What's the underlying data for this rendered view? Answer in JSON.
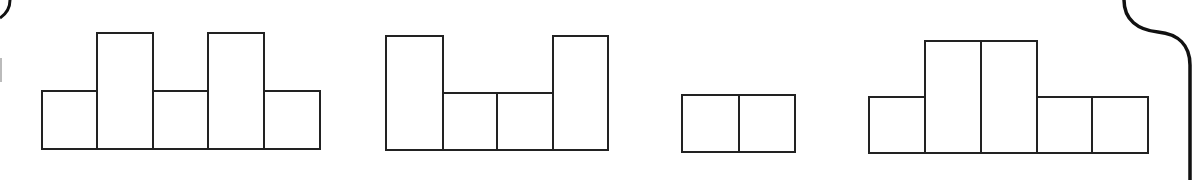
{
  "diagram": {
    "stroke_color": "#222222",
    "background": "#ffffff",
    "figures": [
      {
        "name": "figure-1",
        "columns": [
          {
            "x": 42,
            "width": 55,
            "height_units": 1
          },
          {
            "x": 97,
            "width": 56,
            "height_units": 2
          },
          {
            "x": 153,
            "width": 55,
            "height_units": 1
          },
          {
            "x": 208,
            "width": 56,
            "height_units": 2
          },
          {
            "x": 264,
            "width": 56,
            "height_units": 1
          }
        ]
      },
      {
        "name": "figure-2",
        "columns": [
          {
            "x": 386,
            "width": 57,
            "height_units": 2
          },
          {
            "x": 443,
            "width": 54,
            "height_units": 1
          },
          {
            "x": 497,
            "width": 56,
            "height_units": 1
          },
          {
            "x": 553,
            "width": 55,
            "height_units": 2
          }
        ]
      },
      {
        "name": "figure-3",
        "columns": [
          {
            "x": 682,
            "width": 57,
            "height_units": 1
          },
          {
            "x": 739,
            "width": 56,
            "height_units": 1
          }
        ]
      },
      {
        "name": "figure-4",
        "columns": [
          {
            "x": 869,
            "width": 56,
            "height_units": 1
          },
          {
            "x": 925,
            "width": 56,
            "height_units": 2
          },
          {
            "x": 981,
            "width": 56,
            "height_units": 2
          },
          {
            "x": 1037,
            "width": 55,
            "height_units": 1
          },
          {
            "x": 1092,
            "width": 56,
            "height_units": 1
          }
        ]
      }
    ]
  }
}
